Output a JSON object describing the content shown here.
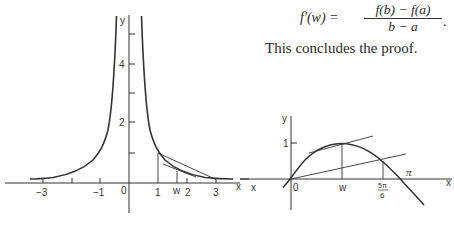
{
  "formula": {
    "lhs": "f′(w) =",
    "numerator": "f(b) − f(a)",
    "denominator": "b − a",
    "trailing": "."
  },
  "conclusion": "This concludes the proof.",
  "figure_left": {
    "function": "y = 1/x²",
    "y_label": "y",
    "x_label": "x",
    "x_ticks": [
      "−3",
      "−1",
      "0",
      "1",
      "w",
      "2",
      "3"
    ],
    "y_ticks": [
      "2",
      "4"
    ],
    "secant_endpoints": [
      "1",
      "3"
    ]
  },
  "figure_right": {
    "function": "y = sin x",
    "y_label": "y",
    "x_label": "x",
    "left_x_label": "x",
    "x_ticks": [
      "0",
      "w",
      "5π/6",
      "π"
    ],
    "y_ticks": [
      "1"
    ],
    "frac_num": "5π",
    "frac_den": "6",
    "pi_label": "π"
  }
}
